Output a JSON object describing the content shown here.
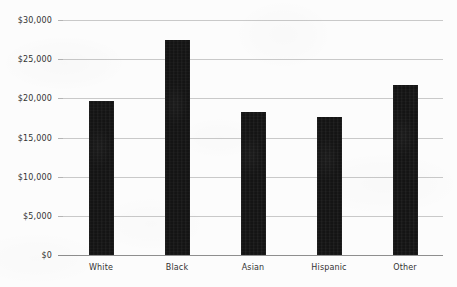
{
  "chart_data": {
    "type": "bar",
    "title": "",
    "subtitle": "",
    "xlabel": "",
    "ylabel": "",
    "categories": [
      "White",
      "Black",
      "Asian",
      "Hispanic",
      "Other"
    ],
    "values": [
      19700,
      27500,
      18200,
      17600,
      21700
    ],
    "series": [
      {
        "name": "",
        "values": [
          19700,
          27500,
          18200,
          17600,
          21700
        ]
      }
    ],
    "ylim": [
      0,
      30000
    ],
    "y_ticks": [
      0,
      5000,
      10000,
      15000,
      20000,
      25000,
      30000
    ],
    "y_tick_labels": [
      "$0",
      "$5,000",
      "$10,000",
      "$15,000",
      "$20,000",
      "$25,000",
      "$30,000"
    ],
    "grid": true,
    "legend": false,
    "legend_position": "none",
    "bar_color": "#141414",
    "gridline_color": "#c9c9c9",
    "axis_color": "#8e8e8e",
    "label_color": "#333333",
    "background_color": "#fcfcfc"
  }
}
